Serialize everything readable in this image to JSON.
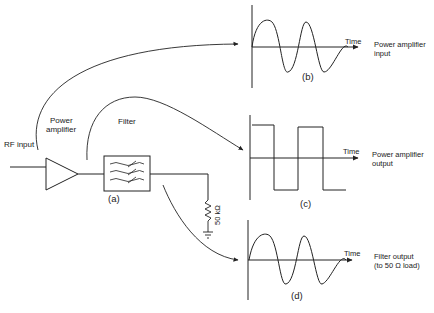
{
  "circuit": {
    "rf_input_label": "RF input",
    "amplifier_label_line1": "Power",
    "amplifier_label_line2": "amplifier",
    "filter_label": "Filter",
    "resistor_label": "50 kΩ",
    "caption": "(a)"
  },
  "waveforms": [
    {
      "id": "b",
      "type": "sine",
      "axis_label": "Time",
      "caption": "(b)",
      "description_line1": "Power amplifier",
      "description_line2": "input"
    },
    {
      "id": "c",
      "type": "square",
      "axis_label": "Time",
      "caption": "(c)",
      "description_line1": "Power amplifier",
      "description_line2": "output"
    },
    {
      "id": "d",
      "type": "sine",
      "axis_label": "Time",
      "caption": "(d)",
      "description_line1": "Filter output",
      "description_line2": "(to 50 Ω load)"
    }
  ],
  "colors": {
    "stroke": "#222222",
    "background": "#ffffff"
  }
}
